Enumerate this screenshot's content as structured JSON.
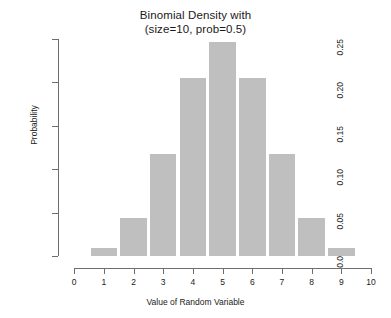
{
  "chart_data": {
    "type": "bar",
    "title": "Binomial Density with (size=10, prob=0.5)",
    "title_line1": "Binomial Density with",
    "title_line2": "(size=10, prob=0.5)",
    "xlabel": "Value of Random Variable",
    "ylabel": "Probability",
    "categories": [
      0,
      1,
      2,
      3,
      4,
      5,
      6,
      7,
      8,
      9,
      10
    ],
    "values": [
      0.001,
      0.0098,
      0.0439,
      0.1172,
      0.2051,
      0.2461,
      0.2051,
      0.1172,
      0.0439,
      0.0098,
      0.001
    ],
    "bars": [
      {
        "x": 1,
        "value": 0.0098
      },
      {
        "x": 2,
        "value": 0.0439
      },
      {
        "x": 3,
        "value": 0.1172
      },
      {
        "x": 4,
        "value": 0.2051
      },
      {
        "x": 5,
        "value": 0.2461
      },
      {
        "x": 6,
        "value": 0.2051
      },
      {
        "x": 7,
        "value": 0.1172
      },
      {
        "x": 8,
        "value": 0.0439
      },
      {
        "x": 9,
        "value": 0.0098
      }
    ],
    "xlim": [
      0,
      10
    ],
    "ylim": [
      0.0,
      0.25
    ],
    "xticks": [
      "0",
      "1",
      "2",
      "3",
      "4",
      "5",
      "6",
      "7",
      "8",
      "9",
      "10"
    ],
    "xtick_values": [
      0,
      1,
      2,
      3,
      4,
      5,
      6,
      7,
      8,
      9,
      10
    ],
    "yticks": [
      "0.0",
      "0.05",
      "0.10",
      "0.15",
      "0.20",
      "0.25"
    ],
    "ytick_values": [
      0.0,
      0.05,
      0.1,
      0.15,
      0.2,
      0.25
    ],
    "grid": false,
    "legend": false,
    "bar_color": "#bfbfbf",
    "axis_color": "#6e6e6e",
    "background": "#ffffff"
  }
}
